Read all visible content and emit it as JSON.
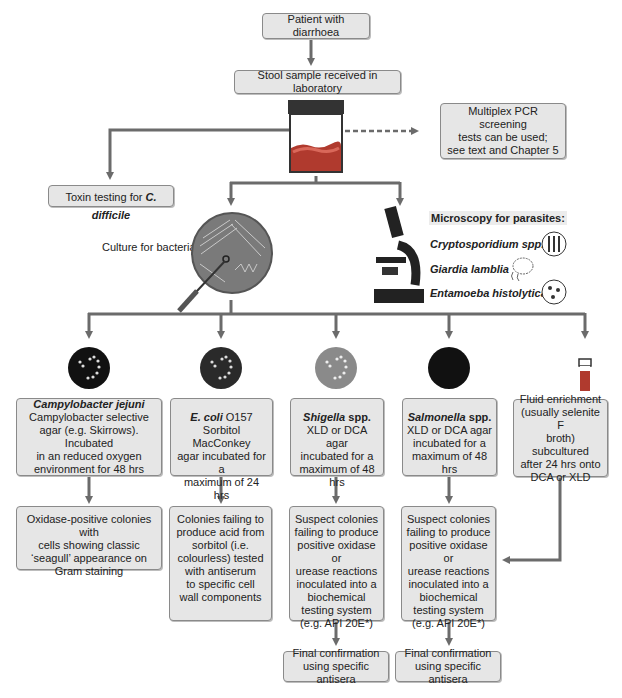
{
  "diagram": {
    "type": "flowchart",
    "start": {
      "label": "Patient with diarrhoea"
    },
    "sample": {
      "label": "Stool sample received in laboratory"
    },
    "pcr": {
      "lines": [
        "Multiplex PCR screening",
        "tests can be used;",
        "see text and Chapter 5"
      ]
    },
    "toxin": {
      "prefix": "Toxin testing for ",
      "organism": "C. difficile"
    },
    "culture": {
      "label": "Culture for bacteria"
    },
    "microscopy": {
      "title": "Microscopy for parasites:",
      "parasites": [
        "Cryptosporidium spp.",
        "Giardia lamblia",
        "Entamoeba histolytica"
      ]
    },
    "branches": [
      {
        "organism": "Campylobacter jejuni",
        "suffix": "",
        "medium_lines": [
          "Campylobacter selective",
          "agar (e.g. Skirrows). Incubated",
          "in an reduced oxygen",
          "environment for 48 hrs"
        ],
        "result_lines": [
          "Oxidase-positive colonies with",
          "cells showing classic",
          "‘seagull’ appearance on",
          "Gram staining"
        ]
      },
      {
        "organism": "E. coli",
        "suffix": " O157",
        "medium_lines": [
          "Sorbitol MacConkey",
          "agar incubated for a",
          "maximum of 24 hrs"
        ],
        "result_lines": [
          "Colonies failing to",
          "produce acid from",
          "sorbitol (i.e.",
          "colourless) tested",
          "with antiserum",
          "to specific cell",
          "wall components"
        ]
      },
      {
        "organism": "Shigella",
        "suffix": " spp.",
        "medium_lines": [
          "XLD or DCA agar",
          "incubated for a",
          "maximum of 48 hrs"
        ],
        "result_lines": [
          "Suspect colonies",
          "failing to produce",
          "positive oxidase or",
          "urease reactions",
          "inoculated into a",
          "biochemical",
          "testing system",
          "(e.g. API 20E*)"
        ],
        "final_lines": [
          "Final confirmation",
          "using specific antisera"
        ]
      },
      {
        "organism": "Salmonella",
        "suffix": " spp.",
        "medium_lines": [
          "XLD or DCA agar",
          "incubated for a",
          "maximum of 48 hrs"
        ],
        "result_lines": [
          "Suspect colonies",
          "failing to produce",
          "positive oxidase or",
          "urease reactions",
          "inoculated into a",
          "biochemical",
          "testing system",
          "(e.g. API 20E*)"
        ],
        "final_lines": [
          "Final confirmation",
          "using specific antisera"
        ]
      },
      {
        "organism": "",
        "suffix": "",
        "medium_lines": [
          "Fluid enrichment",
          "(usually selenite F",
          "broth) subcultured",
          "after 24 hrs onto",
          "DCA or XLD"
        ]
      }
    ],
    "colors": {
      "box_fill": "#e6e6e6",
      "box_border": "#8a8a8a",
      "arrow": "#6b6b6b",
      "plate_gray": "#7a7a7a",
      "stool": "#b03a2e",
      "broth": "#b03a2e"
    }
  }
}
